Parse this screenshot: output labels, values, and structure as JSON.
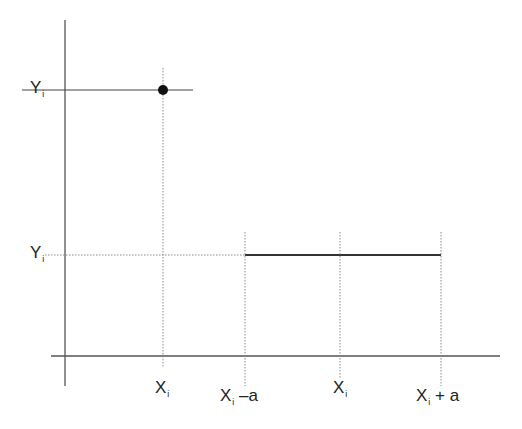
{
  "diagram": {
    "type": "kernel-illustration",
    "colors": {
      "axis": "#555555",
      "line": "#333333",
      "dotted": "#888888",
      "point": "#111111"
    },
    "labels": {
      "y_top": {
        "main": "Y",
        "sub": "i"
      },
      "y_bottom": {
        "main": "Y",
        "sub": "i"
      },
      "x_left": {
        "main": "X",
        "sub": "i"
      },
      "x_minus": {
        "main": "X",
        "sub": "i",
        "suffix": " –a"
      },
      "x_center": {
        "main": "X",
        "sub": "i"
      },
      "x_plus": {
        "main": "X",
        "sub": "i",
        "suffix": " + a"
      }
    }
  }
}
